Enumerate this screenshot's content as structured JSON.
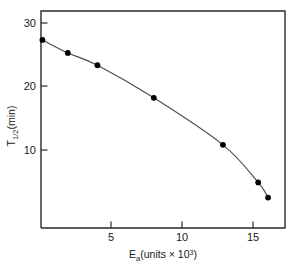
{
  "chart_data": {
    "type": "line",
    "title": "",
    "subtitle": "",
    "xlabel": "E_a (units × 10³)",
    "xlabel_parts": {
      "base": "E",
      "sub": "a",
      "rest": "(units × 10",
      "sup": "3",
      "tail": ")"
    },
    "ylabel": "T₁⼯₂ (min)",
    "ylabel_parts": {
      "base": "T",
      "sub": "1/2",
      "rest": "(min)"
    },
    "x": [
      0.0,
      1.8,
      3.9,
      7.9,
      12.8,
      15.3,
      16.0
    ],
    "values": [
      27.5,
      25.7,
      24.0,
      19.5,
      13.0,
      7.8,
      5.7
    ],
    "series": [
      {
        "name": "T half-life vs Ea",
        "points": [
          {
            "x": 0.0,
            "y": 27.5
          },
          {
            "x": 1.8,
            "y": 25.7
          },
          {
            "x": 3.9,
            "y": 24.0
          },
          {
            "x": 7.9,
            "y": 19.5
          },
          {
            "x": 12.8,
            "y": 13.0
          },
          {
            "x": 15.3,
            "y": 7.8
          },
          {
            "x": 16.0,
            "y": 5.7
          }
        ]
      }
    ],
    "xlim": [
      -0.1,
      17.2
    ],
    "ylim": [
      1.5,
      31.5
    ],
    "xticks": [
      5,
      10,
      15
    ],
    "xtick_labels": [
      "5",
      "10",
      "15"
    ],
    "yticks": [
      10,
      20,
      30
    ],
    "ytick_labels": [
      "10",
      "20",
      "30"
    ],
    "grid": false,
    "legend": null,
    "legend_position": "none",
    "marker": "filled-circle",
    "marker_color": "#000000",
    "line_color": "#4a4a4a",
    "frame_color": "#2a2a2a",
    "background_color": "#ffffff"
  }
}
